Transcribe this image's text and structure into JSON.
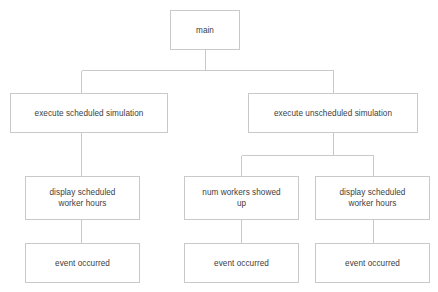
{
  "diagram": {
    "type": "tree",
    "title": "",
    "background_color": "#ffffff",
    "box_border_color": "#c9c9c9",
    "connector_color": "#c9c9c9",
    "text_color": "#3d3d3d",
    "nodes": [
      {
        "id": "main",
        "label": "main",
        "level": 1,
        "x": 170,
        "y": 10,
        "w": 70,
        "h": 40
      },
      {
        "id": "execute-scheduled-simulation",
        "label": "execute scheduled simulation",
        "level": 2,
        "x": 10,
        "y": 93,
        "w": 158,
        "h": 40
      },
      {
        "id": "execute-unscheduled-simulation",
        "label": "execute unscheduled simulation",
        "level": 2,
        "x": 248,
        "y": 93,
        "w": 170,
        "h": 40
      },
      {
        "id": "display-scheduled-worker-hours-left",
        "label": "display scheduled\nworker hours",
        "level": 3,
        "x": 25,
        "y": 176,
        "w": 115,
        "h": 44
      },
      {
        "id": "num-workers-showed-up",
        "label": "num workers showed\nup",
        "level": 3,
        "x": 184,
        "y": 176,
        "w": 115,
        "h": 44
      },
      {
        "id": "display-scheduled-worker-hours-right",
        "label": "display scheduled\nworker hours",
        "level": 3,
        "x": 315,
        "y": 176,
        "w": 115,
        "h": 44
      },
      {
        "id": "event-occurred-left",
        "label": "event occurred",
        "level": 4,
        "x": 25,
        "y": 243,
        "w": 115,
        "h": 40
      },
      {
        "id": "event-occurred-middle",
        "label": "event occurred",
        "level": 4,
        "x": 184,
        "y": 243,
        "w": 115,
        "h": 40
      },
      {
        "id": "event-occurred-right",
        "label": "event occurred",
        "level": 4,
        "x": 315,
        "y": 243,
        "w": 115,
        "h": 40
      }
    ],
    "edges": [
      {
        "id": "main-to-branchbar",
        "from": "main",
        "to": "level2-bar",
        "kind": "orthogonal"
      },
      {
        "id": "branchbar-to-execute-scheduled",
        "from": "level2-bar",
        "to": "execute-scheduled-simulation",
        "kind": "orthogonal"
      },
      {
        "id": "branchbar-to-execute-unscheduled",
        "from": "level2-bar",
        "to": "execute-unscheduled-simulation",
        "kind": "orthogonal"
      },
      {
        "id": "execute-scheduled-to-display-left",
        "from": "execute-scheduled-simulation",
        "to": "display-scheduled-worker-hours-left",
        "kind": "vertical"
      },
      {
        "id": "execute-unscheduled-to-subbar",
        "from": "execute-unscheduled-simulation",
        "to": "level3-bar",
        "kind": "orthogonal"
      },
      {
        "id": "subbar-to-num-workers",
        "from": "level3-bar",
        "to": "num-workers-showed-up",
        "kind": "orthogonal"
      },
      {
        "id": "subbar-to-display-right",
        "from": "level3-bar",
        "to": "display-scheduled-worker-hours-right",
        "kind": "orthogonal"
      },
      {
        "id": "display-left-to-event-left",
        "from": "display-scheduled-worker-hours-left",
        "to": "event-occurred-left",
        "kind": "vertical"
      },
      {
        "id": "num-workers-to-event-middle",
        "from": "num-workers-showed-up",
        "to": "event-occurred-middle",
        "kind": "vertical"
      },
      {
        "id": "display-right-to-event-right",
        "from": "display-scheduled-worker-hours-right",
        "to": "event-occurred-right",
        "kind": "vertical"
      }
    ]
  }
}
